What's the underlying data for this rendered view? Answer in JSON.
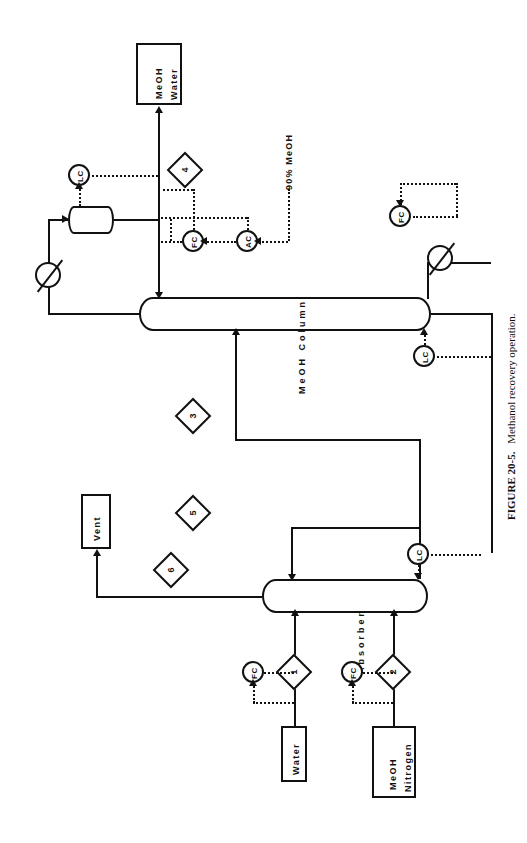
{
  "figure": {
    "number": "FIGURE 20-5.",
    "caption": "Methanol recovery operation.",
    "orientation": "rotated-90-ccw"
  },
  "colors": {
    "line": "#111111",
    "background": "#ffffff"
  },
  "boxes": [
    {
      "id": "product-meoh-water",
      "label_line1": "MeOH",
      "label_line2": "Water"
    },
    {
      "id": "vent",
      "label_line1": "Vent",
      "label_line2": ""
    },
    {
      "id": "feed-water",
      "label_line1": "Water",
      "label_line2": ""
    },
    {
      "id": "feed-meoh-nitrogen",
      "label_line1": "MeOH",
      "label_line2": "Nitrogen"
    }
  ],
  "vessels": [
    {
      "id": "meoh-column",
      "label": "MeOH Column"
    },
    {
      "id": "absorber",
      "label": "Absorber"
    },
    {
      "id": "reflux-drum",
      "label": ""
    }
  ],
  "instruments": [
    {
      "id": "lc-reflux-drum",
      "tag": "LC"
    },
    {
      "id": "fc-reflux",
      "tag": "FC"
    },
    {
      "id": "ac-composition",
      "tag": "AC"
    },
    {
      "id": "fc-reboiler-steam",
      "tag": "FC"
    },
    {
      "id": "lc-column-bottoms",
      "tag": "LC"
    },
    {
      "id": "lc-absorber-bottoms",
      "tag": "LC"
    },
    {
      "id": "fc-water-feed",
      "tag": "FC"
    },
    {
      "id": "fc-gas-feed",
      "tag": "FC"
    }
  ],
  "heat_exchangers": [
    {
      "id": "condenser",
      "label": ""
    },
    {
      "id": "reboiler",
      "label": ""
    }
  ],
  "streams": [
    {
      "id": "stream-1",
      "number": "1"
    },
    {
      "id": "stream-2",
      "number": "2"
    },
    {
      "id": "stream-3",
      "number": "3"
    },
    {
      "id": "stream-4",
      "number": "4"
    },
    {
      "id": "stream-5",
      "number": "5"
    },
    {
      "id": "stream-6",
      "number": "6"
    }
  ],
  "annotations": [
    {
      "id": "purity-note",
      "text": "90% MeOH"
    }
  ]
}
